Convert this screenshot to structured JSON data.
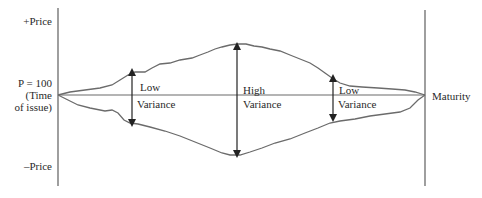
{
  "diagram": {
    "type": "bond-price-variance-over-time",
    "colors": {
      "line": "#6b6b6b",
      "text": "#2a2a2a",
      "background": "#ffffff"
    },
    "y_axis": {
      "top_label": "+Price",
      "middle_label_line1": "P = 100",
      "middle_label_line2": "(Time",
      "middle_label_line3": "of issue)",
      "bottom_label": "–Price"
    },
    "x_axis": {
      "end_label": "Maturity"
    },
    "annotations": [
      {
        "id": "left",
        "line1": "Low",
        "line2": "Variance"
      },
      {
        "id": "center",
        "line1": "High",
        "line2": "Variance"
      },
      {
        "id": "right",
        "line1": "Low",
        "line2": "Variance"
      }
    ]
  }
}
